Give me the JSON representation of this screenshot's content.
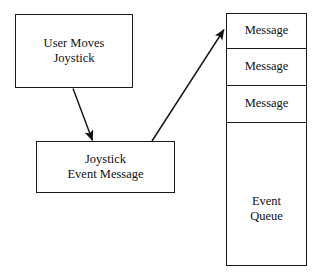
{
  "diagram": {
    "background_color": "#ffffff",
    "stroke_color": "#1a1a1a",
    "text_color": "#111111",
    "boxes": [
      {
        "id": "user-moves",
        "lines": [
          "User Moves",
          "Joystick"
        ]
      },
      {
        "id": "joystick-event",
        "lines": [
          "Joystick",
          "Event Message"
        ]
      }
    ],
    "queue": {
      "label_lines": [
        "Event",
        "Queue"
      ],
      "cells": [
        {
          "label": "Message"
        },
        {
          "label": "Message"
        },
        {
          "label": "Message"
        }
      ]
    },
    "arrows": [
      {
        "id": "user-to-message",
        "from": "user-moves-box",
        "to": "joystick-event-box",
        "direction": "down-right"
      },
      {
        "id": "message-to-queue",
        "from": "joystick-event-box",
        "to": "event-queue-top",
        "direction": "up-right"
      }
    ]
  }
}
